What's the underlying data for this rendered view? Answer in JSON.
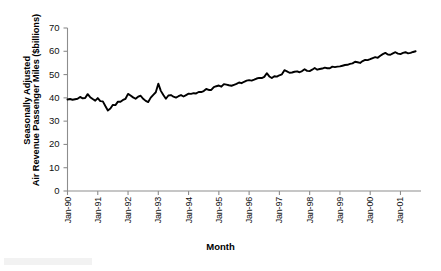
{
  "chart_data": {
    "type": "line",
    "title": "",
    "xlabel": "Month",
    "ylabel_line1": "Seasonally Adjusted",
    "ylabel_line2": "Air Revenue Passenger Miles ($billions)",
    "ylim": [
      0,
      70
    ],
    "yticks": [
      0,
      10,
      20,
      30,
      40,
      50,
      60,
      70
    ],
    "xticks": [
      "Jan-90",
      "Jan-91",
      "Jan-92",
      "Jan-93",
      "Jan-94",
      "Jan-95",
      "Jan-96",
      "Jan-97",
      "Jan-98",
      "Jan-99",
      "Jan-00",
      "Jan-01"
    ],
    "grid": false,
    "legend": null,
    "series_color": "#000000",
    "x_start": "Jan-90",
    "x_end": "Jun-01",
    "series": [
      {
        "name": "Seasonally Adjusted Air Revenue Passenger Miles",
        "values": [
          39.3,
          39.5,
          39.2,
          39.4,
          39.6,
          40.4,
          39.8,
          39.9,
          41.6,
          40.3,
          39.5,
          38.8,
          39.9,
          38.6,
          38.5,
          36.5,
          34.6,
          35.4,
          37.0,
          36.9,
          38.4,
          38.3,
          39.1,
          39.6,
          41.7,
          41.0,
          40.2,
          39.6,
          40.5,
          40.9,
          39.6,
          38.7,
          38.2,
          40.1,
          41.3,
          42.4,
          46.1,
          43.0,
          41.2,
          39.6,
          41.0,
          41.2,
          40.5,
          40.1,
          40.7,
          41.2,
          40.6,
          41.2,
          41.8,
          41.7,
          42.0,
          41.9,
          42.5,
          42.5,
          42.9,
          43.8,
          43.4,
          43.4,
          44.6,
          45.0,
          45.3,
          44.8,
          45.9,
          45.7,
          45.4,
          45.2,
          45.6,
          46.0,
          46.6,
          46.3,
          46.9,
          47.4,
          47.6,
          47.4,
          47.8,
          48.3,
          48.6,
          48.5,
          49.0,
          50.6,
          49.2,
          48.5,
          49.3,
          49.1,
          49.7,
          50.1,
          51.9,
          51.4,
          50.8,
          50.9,
          51.2,
          51.4,
          51.0,
          51.5,
          52.3,
          51.6,
          51.5,
          52.1,
          52.8,
          52.1,
          52.4,
          52.6,
          53.0,
          52.7,
          52.7,
          53.4,
          53.2,
          53.4,
          53.5,
          53.8,
          54.1,
          54.2,
          54.6,
          54.8,
          55.5,
          55.3,
          55.0,
          55.8,
          56.3,
          56.2,
          56.6,
          57.1,
          57.5,
          57.2,
          58.1,
          58.8,
          59.3,
          58.6,
          58.5,
          59.1,
          59.6,
          59.0,
          58.8,
          59.3,
          59.6,
          59.1,
          59.3,
          59.7,
          60.0
        ]
      }
    ]
  },
  "axis": {
    "y_tick_labels": [
      "70",
      "60",
      "50",
      "40",
      "30",
      "20",
      "10",
      "0"
    ]
  }
}
